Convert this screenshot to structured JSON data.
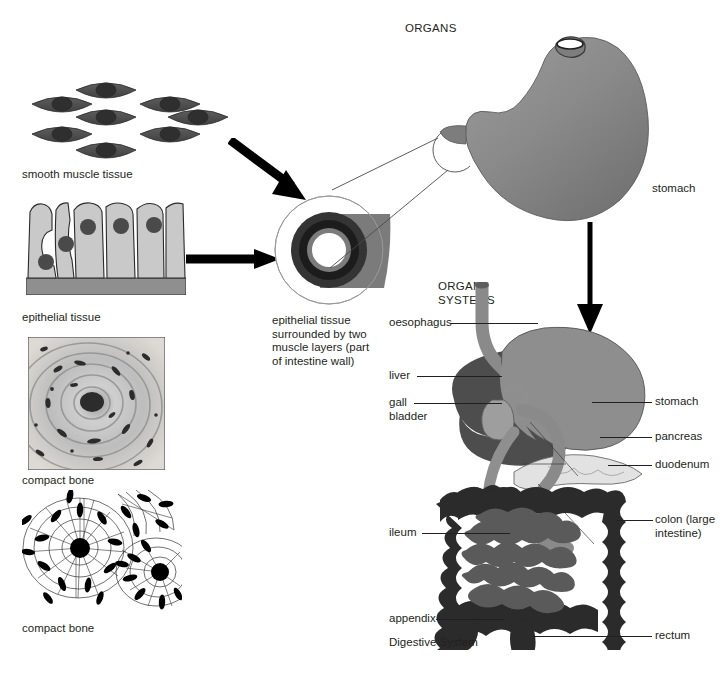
{
  "figure": {
    "title": "Digestive System",
    "levels": [
      "ORGANS",
      "ORGAN SYSTEMS"
    ]
  },
  "headers": {
    "organs": "ORGANS",
    "organ_systems": "ORGAN\nSYSTEMS"
  },
  "tissues": [
    {
      "id": "smooth-muscle",
      "label": "smooth muscle tissue"
    },
    {
      "id": "epithelial",
      "label": "epithelial tissue"
    },
    {
      "id": "compact-bone-micrograph",
      "label": "compact bone"
    },
    {
      "id": "compact-bone-diagram",
      "label": "compact bone"
    }
  ],
  "cross_section": {
    "caption": "epithelial tissue\nsurrounded by two\nmuscle layers (part\nof intestine wall)"
  },
  "organ": {
    "stomach_label": "stomach"
  },
  "organ_system": {
    "name": "Digestive System",
    "labels_left": [
      {
        "id": "oesophagus",
        "text": "oesophagus"
      },
      {
        "id": "liver",
        "text": "liver"
      },
      {
        "id": "gall-bladder",
        "text": "gall\nbladder"
      },
      {
        "id": "ileum",
        "text": "ileum"
      },
      {
        "id": "appendix",
        "text": "appendix"
      }
    ],
    "labels_right": [
      {
        "id": "stomach",
        "text": "stomach"
      },
      {
        "id": "pancreas",
        "text": "pancreas"
      },
      {
        "id": "duodenum",
        "text": "duodenum"
      },
      {
        "id": "colon",
        "text": "colon (large\nintestine)"
      },
      {
        "id": "rectum",
        "text": "rectum"
      }
    ]
  },
  "colors": {
    "ink": "#231f20",
    "muscle_dark": "#4e4e4e",
    "muscle_nucleus": "#3a3a3a",
    "epithelium_fill": "#c9c9c9",
    "epithelium_base": "#8f8f8f",
    "stomach_fill": "#8a8a8a",
    "liver_fill": "#5a5a5a",
    "intestine_fill": "#2f2f2f",
    "duct_fill": "#9a9a9a",
    "pancreas_fill": "#dcdcdc",
    "ring_outer": "#7f7f7f",
    "ring_mid": "#3a3a3a",
    "ring_inner": "#6f6f6f",
    "background": "#ffffff"
  }
}
